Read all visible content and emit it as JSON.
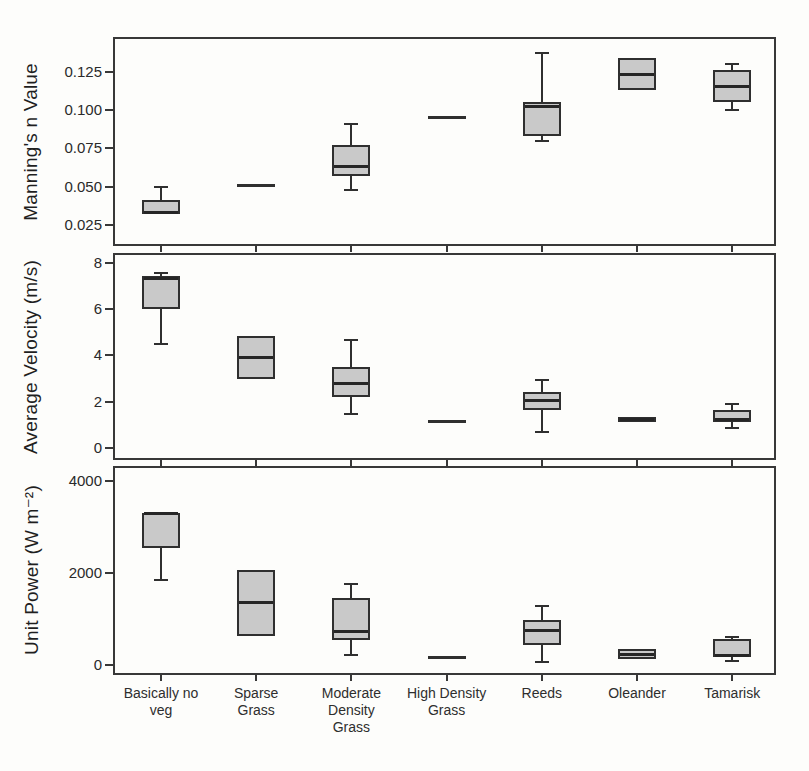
{
  "figure": {
    "background": "#fdfdfb",
    "box_fill": "#c9c9c9",
    "box_border": "#2f2f2f",
    "axis_color": "#383838",
    "text_color": "#2a2a2a"
  },
  "chart_data": {
    "type": "box",
    "orientation": "vertical",
    "grid": false,
    "legend": null,
    "categories": [
      "Basically no veg",
      "Sparse Grass",
      "Moderate Density Grass",
      "High Density Grass",
      "Reeds",
      "Oleander",
      "Tamarisk"
    ],
    "category_labels_wrapped": [
      "Basically no\nveg",
      "Sparse\nGrass",
      "Moderate\nDensity\nGrass",
      "High Density\nGrass",
      "Reeds",
      "Oleander",
      "Tamarisk"
    ],
    "panels": [
      {
        "ylabel": "Manning's n Value",
        "ylim": [
          0.0126,
          0.1463
        ],
        "yticks": [
          {
            "value": 0.125,
            "label": "0.125"
          },
          {
            "value": 0.1,
            "label": "0.100"
          },
          {
            "value": 0.075,
            "label": "0.075"
          },
          {
            "value": 0.05,
            "label": "0.050"
          },
          {
            "value": 0.025,
            "label": "0.025"
          }
        ],
        "boxes": [
          {
            "category": "Basically no veg",
            "whisker_low": 0.032,
            "q1": 0.032,
            "median": 0.033,
            "q3": 0.041,
            "whisker_high": 0.05
          },
          {
            "category": "Sparse Grass",
            "style": "line",
            "value": 0.051
          },
          {
            "category": "Moderate Density Grass",
            "whisker_low": 0.048,
            "q1": 0.057,
            "median": 0.063,
            "q3": 0.077,
            "whisker_high": 0.091
          },
          {
            "category": "High Density Grass",
            "style": "line",
            "value": 0.095
          },
          {
            "category": "Reeds",
            "whisker_low": 0.08,
            "q1": 0.083,
            "median": 0.102,
            "q3": 0.105,
            "whisker_high": 0.137
          },
          {
            "category": "Oleander",
            "q1": 0.113,
            "median": 0.123,
            "q3": 0.134
          },
          {
            "category": "Tamarisk",
            "whisker_low": 0.1,
            "q1": 0.105,
            "median": 0.115,
            "q3": 0.126,
            "whisker_high": 0.13
          }
        ]
      },
      {
        "ylabel": "Average Velocity (m/s)",
        "ylim": [
          -0.45,
          8.36
        ],
        "yticks": [
          {
            "value": 8,
            "label": "8"
          },
          {
            "value": 6,
            "label": "6"
          },
          {
            "value": 4,
            "label": "4"
          },
          {
            "value": 2,
            "label": "2"
          },
          {
            "value": 0,
            "label": "0"
          }
        ],
        "boxes": [
          {
            "category": "Basically no veg",
            "whisker_low": 4.5,
            "q1": 6.0,
            "median": 7.35,
            "q3": 7.45,
            "whisker_high": 7.6
          },
          {
            "category": "Sparse Grass",
            "q1": 3.0,
            "median": 3.9,
            "q3": 4.85
          },
          {
            "category": "Moderate Density Grass",
            "whisker_low": 1.45,
            "q1": 2.2,
            "median": 2.8,
            "q3": 3.5,
            "whisker_high": 4.65
          },
          {
            "category": "High Density Grass",
            "style": "line",
            "value": 1.15
          },
          {
            "category": "Reeds",
            "whisker_low": 0.7,
            "q1": 1.65,
            "median": 2.05,
            "q3": 2.4,
            "whisker_high": 2.95
          },
          {
            "category": "Oleander",
            "q1": 1.1,
            "median": 1.2,
            "q3": 1.35,
            "fill": "#474747"
          },
          {
            "category": "Tamarisk",
            "whisker_low": 0.85,
            "q1": 1.1,
            "median": 1.2,
            "q3": 1.65,
            "whisker_high": 1.9
          }
        ]
      },
      {
        "ylabel": "Unit Power (W m⁻²)",
        "ylim": [
          -174,
          4283
        ],
        "yticks": [
          {
            "value": 4000,
            "label": "4000"
          },
          {
            "value": 2000,
            "label": "2000"
          },
          {
            "value": 0,
            "label": "0"
          }
        ],
        "boxes": [
          {
            "category": "Basically no veg",
            "whisker_low": 1850,
            "q1": 2550,
            "median": 3300,
            "q3": 3310
          },
          {
            "category": "Sparse Grass",
            "q1": 640,
            "median": 1365,
            "q3": 2070
          },
          {
            "category": "Moderate Density Grass",
            "whisker_low": 215,
            "q1": 535,
            "median": 720,
            "q3": 1450,
            "whisker_high": 1760
          },
          {
            "category": "High Density Grass",
            "style": "line",
            "value": 160
          },
          {
            "category": "Reeds",
            "whisker_low": 70,
            "q1": 430,
            "median": 740,
            "q3": 985,
            "whisker_high": 1280
          },
          {
            "category": "Oleander",
            "q1": 130,
            "median": 235,
            "q3": 345
          },
          {
            "category": "Tamarisk",
            "whisker_low": 80,
            "q1": 170,
            "median": 215,
            "q3": 555,
            "whisker_high": 610
          }
        ]
      }
    ]
  }
}
